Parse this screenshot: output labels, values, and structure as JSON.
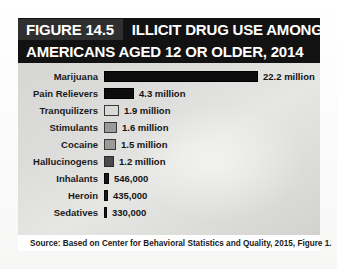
{
  "figure": {
    "number_label": "FIGURE 14.5",
    "title_line_1": "ILLICIT DRUG USE AMONG",
    "title_line_2": "AMERICANS AGED 12 OR OLDER, 2014",
    "source": "Source: Based on Center for Behavioral Statistics and Quality, 2015, Figure 1."
  },
  "colors": {
    "header_background": "#121212",
    "number_block_background": "#2f2f2f",
    "header_text": "#ffffff",
    "panel_background": "#dcdcda",
    "bar_solid_black": "#0d0d0d",
    "bar_light_gray": "#d9d9d7",
    "bar_mid_gray": "#9a9a98",
    "bar_dark_gray": "#4a4a4a",
    "bar_outline": "#3a3a3a",
    "page_background": "#ffffff",
    "label_text": "#1b1b1b"
  },
  "chart_data": {
    "type": "bar",
    "orientation": "horizontal",
    "title": "FIGURE 14.5  ILLICIT DRUG USE AMONG AMERICANS AGED 12 OR OLDER, 2014",
    "xlabel": "",
    "ylabel": "",
    "grid": false,
    "legend": "none",
    "axis_visible": false,
    "units": "people (past-month users)",
    "xlim": [
      0,
      22200000
    ],
    "categories": [
      "Marijuana",
      "Pain Relievers",
      "Tranquilizers",
      "Stimulants",
      "Cocaine",
      "Hallucinogens",
      "Inhalants",
      "Heroin",
      "Sedatives"
    ],
    "values": [
      22200000,
      4300000,
      1900000,
      1600000,
      1500000,
      1200000,
      546000,
      435000,
      330000
    ],
    "value_labels": [
      "22.2 million",
      "4.3 million",
      "1.9 million",
      "1.6 million",
      "1.5 million",
      "1.2 million",
      "546,000",
      "435,000",
      "330,000"
    ],
    "bars": [
      {
        "label": "Marijuana",
        "value": 22200000,
        "value_label": "22.2 million",
        "pixel_width": 154,
        "fill_style": "style-solid-black"
      },
      {
        "label": "Pain Relievers",
        "value": 4300000,
        "value_label": "4.3 million",
        "pixel_width": 30,
        "fill_style": "style-solid-black"
      },
      {
        "label": "Tranquilizers",
        "value": 1900000,
        "value_label": "1.9 million",
        "pixel_width": 15,
        "fill_style": "style-light-gray"
      },
      {
        "label": "Stimulants",
        "value": 1600000,
        "value_label": "1.6 million",
        "pixel_width": 13,
        "fill_style": "style-mid-gray"
      },
      {
        "label": "Cocaine",
        "value": 1500000,
        "value_label": "1.5 million",
        "pixel_width": 12,
        "fill_style": "style-mid-gray"
      },
      {
        "label": "Hallucinogens",
        "value": 1200000,
        "value_label": "1.2 million",
        "pixel_width": 10,
        "fill_style": "style-dark-gray"
      },
      {
        "label": "Inhalants",
        "value": 546000,
        "value_label": "546,000",
        "pixel_width": 5,
        "fill_style": "style-thin-black"
      },
      {
        "label": "Heroin",
        "value": 435000,
        "value_label": "435,000",
        "pixel_width": 4,
        "fill_style": "style-thin-black"
      },
      {
        "label": "Sedatives",
        "value": 330000,
        "value_label": "330,000",
        "pixel_width": 3,
        "fill_style": "style-thin-black"
      }
    ]
  }
}
